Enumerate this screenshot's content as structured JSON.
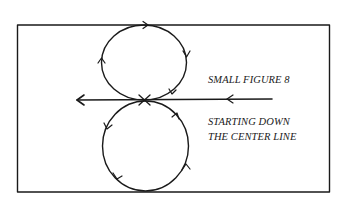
{
  "diagram": {
    "title": "SMALL FIGURE 8",
    "caption": {
      "line1": "STARTING DOWN",
      "line2": "THE CENTER LINE"
    },
    "elements": {
      "frame": "arena-border",
      "center_line": "horizontal line with arrow pointing left",
      "upper_loop": "circle traveled clockwise",
      "lower_loop": "circle traveled counterclockwise",
      "crossing": "X mark at center where loops meet"
    },
    "colors": {
      "ink": "#1a1a1a",
      "background": "#ffffff"
    }
  }
}
